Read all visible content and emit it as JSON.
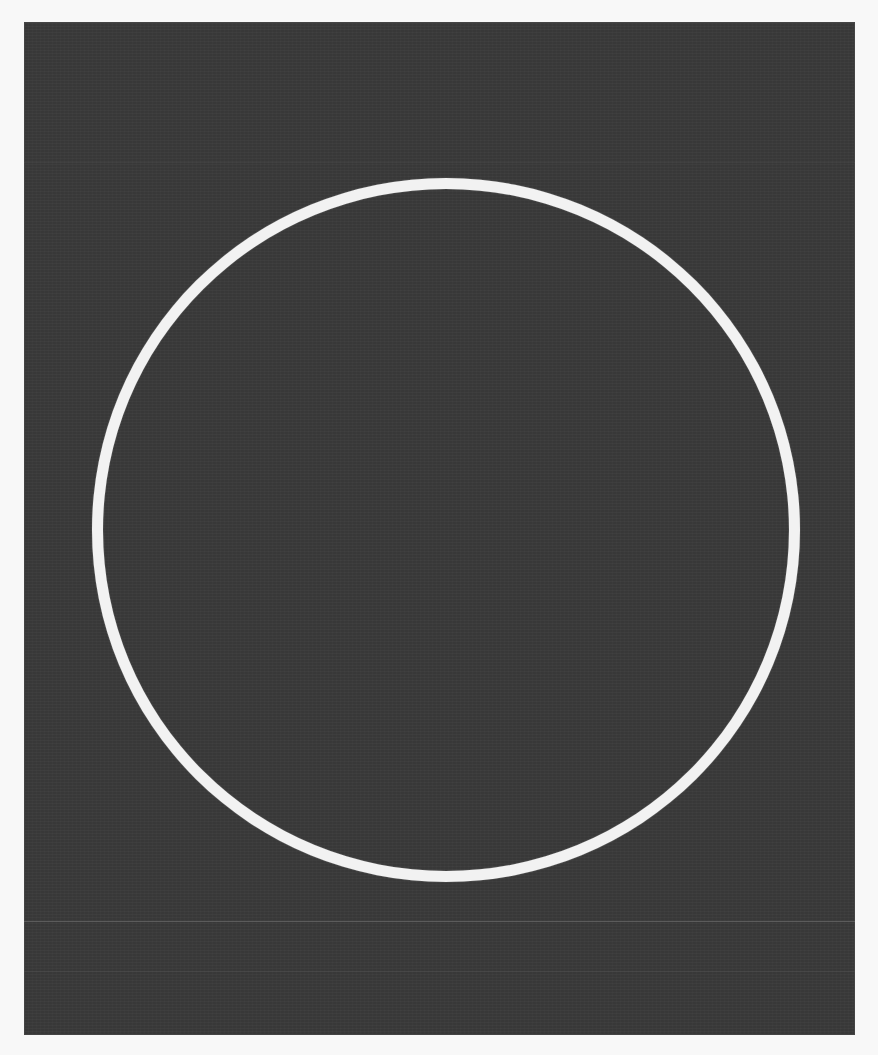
{
  "scene": {
    "description": "White circular ring on a dark textured panel",
    "background_color": "#f8f8f8",
    "panel_color": "#3a3a3a",
    "ring_color": "#f2f2f2"
  },
  "shapes": [
    {
      "type": "rectangle",
      "name": "dark-panel"
    },
    {
      "type": "circle-outline",
      "name": "white-ring"
    }
  ]
}
